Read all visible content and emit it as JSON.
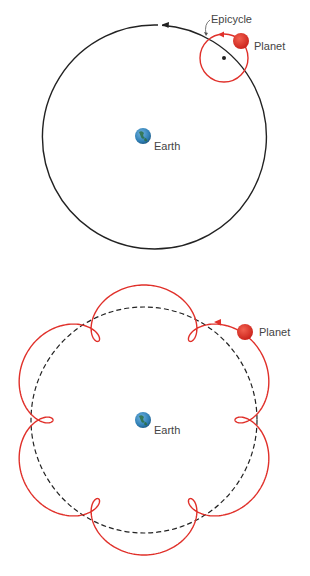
{
  "colors": {
    "background": "#ffffff",
    "deferent": "#222222",
    "epicycle": "#e0302a",
    "planet": "#dd2a22",
    "earth": "#2f7fb5",
    "label": "#444444"
  },
  "top_diagram": {
    "title": "Epicycle model",
    "earth_label": "Earth",
    "planet_label": "Planet",
    "epicycle_label": "Epicycle",
    "deferent": {
      "cx": 144,
      "cy": 136,
      "r": 112
    },
    "epicycle": {
      "cx": 224,
      "cy": 58,
      "r": 24
    },
    "planet": {
      "cx": 241,
      "cy": 41,
      "r": 8
    },
    "earth": {
      "cx": 143,
      "cy": 136,
      "r": 8
    }
  },
  "bottom_diagram": {
    "title": "Resulting planetary path with retrograde loops",
    "earth_label": "Earth",
    "planet_label": "Planet",
    "deferent": {
      "cx": 144,
      "cy": 420,
      "r": 113
    },
    "epicycle_radius": 22,
    "loops": 6,
    "planet": {
      "cx": 245,
      "cy": 332,
      "r": 8
    },
    "earth": {
      "cx": 143,
      "cy": 420,
      "r": 8
    }
  }
}
